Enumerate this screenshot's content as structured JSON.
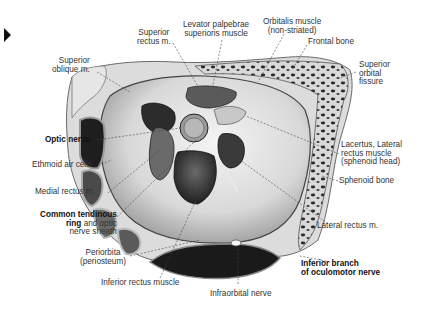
{
  "figure": {
    "marker_icon": "play-triangle-icon",
    "colors": {
      "background": "#ffffff",
      "text": "#333333",
      "bone": "#d6d6d6",
      "dark": "#2b2b2b",
      "muscle": "#555555"
    }
  },
  "labels": {
    "superior_rectus": {
      "line1": "Superior",
      "line2": "rectus m."
    },
    "levator": {
      "line1": "Levator palpebrae",
      "line2": "superioris muscle"
    },
    "orbitalis": {
      "line1": "Orbitalis muscle",
      "line2": "(non-striated)"
    },
    "frontal_bone": {
      "text": "Frontal bone"
    },
    "superior_oblique": {
      "line1": "Superior",
      "line2": "oblique m."
    },
    "superior_orbital_fissure": {
      "line1": "Superior",
      "line2": "orbital",
      "line3": "fissure"
    },
    "optic_nerve": {
      "text": "Optic nerve"
    },
    "ethmoid_air_cells": {
      "text": "Ethmoid air cells"
    },
    "lacertus": {
      "line1": "Lacertus, Lateral",
      "line2": "rectus muscle",
      "line3": "(sphenoid head)"
    },
    "medial_rectus": {
      "text": "Medial rectus m."
    },
    "sphenoid_bone": {
      "text": "Sphenoid bone"
    },
    "common_tendinous_ring": {
      "bold1": "Common tendinous",
      "bold2": "ring",
      "rest2": " and optic",
      "line3": "nerve sheath"
    },
    "lateral_rectus": {
      "text": "Lateral rectus m."
    },
    "periorbita": {
      "line1": "Periorbita",
      "line2": "(periosteum)"
    },
    "inferior_branch": {
      "line1": "Inferior branch",
      "line2": "of oculomotor nerve"
    },
    "inferior_rectus": {
      "text": "Inferior rectus muscle"
    },
    "infraorbital_nerve": {
      "text": "Infraorbital nerve"
    }
  }
}
